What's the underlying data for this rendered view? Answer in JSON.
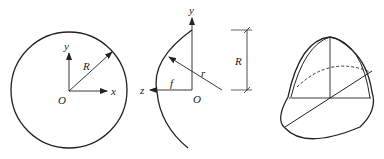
{
  "figure_a": {
    "labels": {
      "y": "y",
      "R": "R",
      "O": "O",
      "x": "x"
    }
  },
  "figure_b": {
    "labels": {
      "y": "y",
      "z": "z",
      "f": "f",
      "O": "O",
      "r": "r",
      "R": "R"
    }
  },
  "figure_c": {},
  "colors": {
    "stroke": "#222222",
    "background": "#ffffff"
  }
}
